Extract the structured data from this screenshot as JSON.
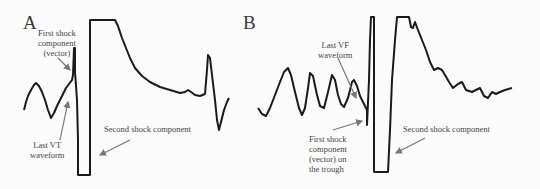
{
  "panels": [
    {
      "label": "A",
      "annotations": {
        "first_shock": "First shock\ncomponent\n(vector)",
        "last_wave": "Last VT\nwaveform",
        "second_shock": "Second shock component"
      }
    },
    {
      "label": "B",
      "annotations": {
        "last_wave": "Last VF\nwaveform",
        "first_shock": "First shock\ncomponent\n(vector) on\nthe trough",
        "second_shock": "Second shock component"
      }
    }
  ],
  "colors": {
    "trace": "#1a1a1a",
    "arrow": "#777777",
    "text": "#444444"
  }
}
